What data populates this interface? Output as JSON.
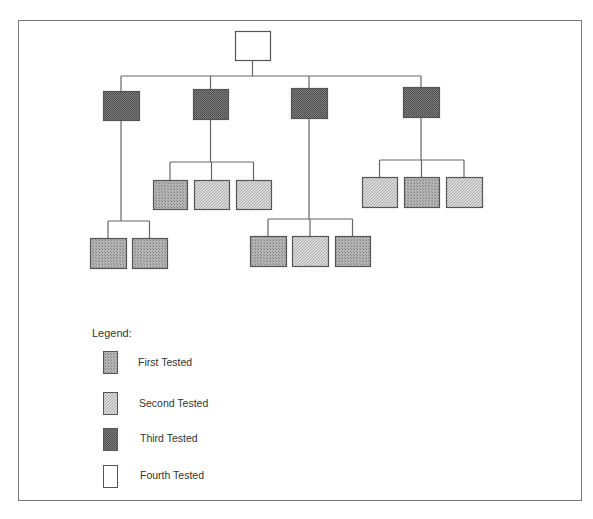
{
  "frame": {
    "x": 18,
    "y": 20,
    "w": 563,
    "h": 480
  },
  "styles": {
    "first": {
      "fill": "#a8a8a8",
      "pattern": "p-first"
    },
    "second": {
      "fill": "#cfcfcf",
      "pattern": "p-second"
    },
    "third": {
      "fill": "#6a6a6a",
      "pattern": "p-third"
    },
    "fourth": {
      "fill": "#ffffff",
      "pattern": null
    },
    "stroke": "#555555",
    "line": "#666666"
  },
  "tree": {
    "root": {
      "id": "root",
      "x": 235,
      "y": 31,
      "w": 35,
      "h": 29,
      "status": "fourth"
    },
    "trunk_y": 76,
    "children": [
      {
        "id": "node-1",
        "x": 103,
        "y": 91,
        "w": 36,
        "h": 29,
        "status": "third",
        "bar_y": 221,
        "children": [
          {
            "id": "node-1-1",
            "x": 90,
            "y": 238,
            "w": 36,
            "h": 30,
            "status": "first"
          },
          {
            "id": "node-1-2",
            "x": 132,
            "y": 238,
            "w": 35,
            "h": 30,
            "status": "first"
          }
        ]
      },
      {
        "id": "node-2",
        "x": 193,
        "y": 89,
        "w": 35,
        "h": 30,
        "status": "third",
        "bar_y": 162,
        "children": [
          {
            "id": "node-2-1",
            "x": 153,
            "y": 180,
            "w": 34,
            "h": 29,
            "status": "first"
          },
          {
            "id": "node-2-2",
            "x": 194,
            "y": 180,
            "w": 35,
            "h": 29,
            "status": "second"
          },
          {
            "id": "node-2-3",
            "x": 236,
            "y": 180,
            "w": 35,
            "h": 29,
            "status": "second"
          }
        ]
      },
      {
        "id": "node-3",
        "x": 291,
        "y": 88,
        "w": 36,
        "h": 30,
        "status": "third",
        "bar_y": 219,
        "children": [
          {
            "id": "node-3-1",
            "x": 250,
            "y": 236,
            "w": 36,
            "h": 30,
            "status": "first"
          },
          {
            "id": "node-3-2",
            "x": 292,
            "y": 236,
            "w": 36,
            "h": 30,
            "status": "second"
          },
          {
            "id": "node-3-3",
            "x": 335,
            "y": 236,
            "w": 35,
            "h": 30,
            "status": "first"
          }
        ]
      },
      {
        "id": "node-4",
        "x": 403,
        "y": 87,
        "w": 36,
        "h": 30,
        "status": "third",
        "bar_y": 160,
        "children": [
          {
            "id": "node-4-1",
            "x": 362,
            "y": 177,
            "w": 35,
            "h": 30,
            "status": "second"
          },
          {
            "id": "node-4-2",
            "x": 404,
            "y": 177,
            "w": 35,
            "h": 30,
            "status": "first"
          },
          {
            "id": "node-4-3",
            "x": 446,
            "y": 177,
            "w": 36,
            "h": 30,
            "status": "second"
          }
        ]
      }
    ]
  },
  "legend": {
    "title": "Legend:",
    "title_pos": {
      "x": 92,
      "y": 327
    },
    "items": [
      {
        "status": "first",
        "label": "First Tested",
        "swatch": {
          "x": 103,
          "y": 351,
          "w": 14,
          "h": 22
        },
        "label_pos": {
          "x": 138,
          "y": 356
        }
      },
      {
        "status": "second",
        "label": "Second Tested",
        "swatch": {
          "x": 103,
          "y": 392,
          "w": 14,
          "h": 22
        },
        "label_pos": {
          "x": 139,
          "y": 397
        }
      },
      {
        "status": "third",
        "label": "Third Tested",
        "swatch": {
          "x": 103,
          "y": 428,
          "w": 14,
          "h": 22
        },
        "label_pos": {
          "x": 140,
          "y": 432
        }
      },
      {
        "status": "fourth",
        "label": "Fourth Tested",
        "swatch": {
          "x": 103,
          "y": 465,
          "w": 14,
          "h": 22
        },
        "label_pos": {
          "x": 140,
          "y": 469
        }
      }
    ]
  }
}
